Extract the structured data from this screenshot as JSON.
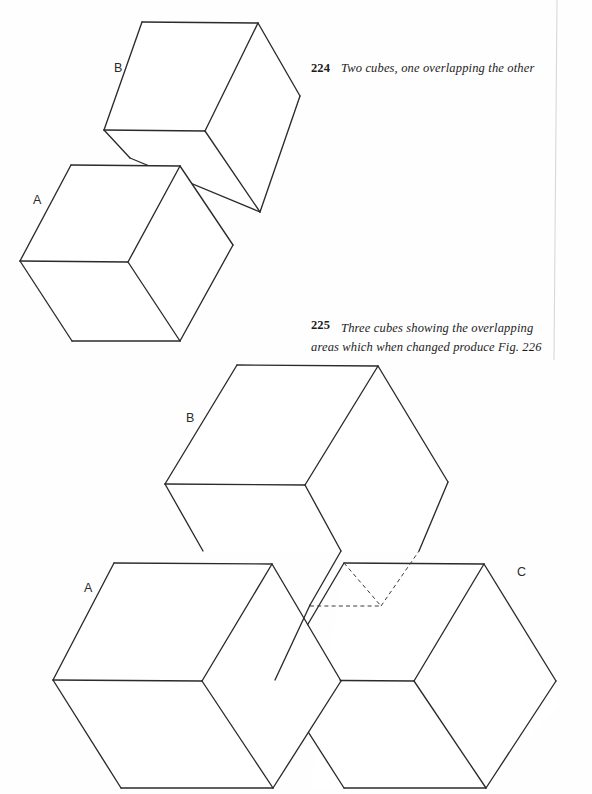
{
  "page": {
    "width": 592,
    "height": 794,
    "background": "#fefefe",
    "ink_color": "#2b2b2b"
  },
  "figures": [
    {
      "id": "fig-224",
      "number": "224",
      "caption": "Two cubes, one overlapping the other",
      "labels": [
        {
          "text": "A",
          "x": 33,
          "y": 204
        },
        {
          "text": "B",
          "x": 114,
          "y": 72
        }
      ]
    },
    {
      "id": "fig-225",
      "number": "225",
      "caption": "Three cubes showing the overlapping areas which when changed produce Fig. 226",
      "labels": [
        {
          "text": "A",
          "x": 84,
          "y": 592
        },
        {
          "text": "B",
          "x": 186,
          "y": 422
        },
        {
          "text": "C",
          "x": 517,
          "y": 576
        }
      ]
    }
  ],
  "captions": {
    "fig224": {
      "number": "224",
      "text": "Two cubes, one overlapping the other"
    },
    "fig225": {
      "number": "225",
      "text": "Three cubes showing the overlapping areas which when changed produce Fig. 226"
    }
  },
  "vertex_labels": {
    "fig224_a": "A",
    "fig224_b": "B",
    "fig225_a": "A",
    "fig225_b": "B",
    "fig225_c": "C"
  },
  "colors": {
    "ink": "#2b2b2b",
    "hidden_line": "#3a3a3a",
    "paper": "#fefefe",
    "page_edge": "#d8d8d8"
  },
  "drawing": {
    "type": "line-drawing",
    "subject": "isometric cubes / impossible figure study",
    "line_style_solid": "solid",
    "line_style_hidden": "dashed"
  }
}
